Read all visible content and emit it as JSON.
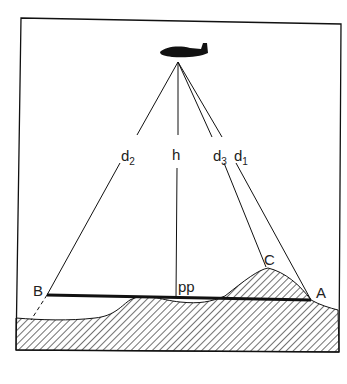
{
  "diagram": {
    "labels": {
      "d2": "d",
      "d2_sub": "2",
      "h": "h",
      "d3": "d",
      "d3_sub": "3",
      "d1": "d",
      "d1_sub": "1",
      "B": "B",
      "A": "A",
      "C": "C",
      "pp": "pp"
    },
    "icons": {
      "aircraft": "airplane-silhouette"
    },
    "colors": {
      "ink": "#111111",
      "background": "#ffffff"
    }
  }
}
